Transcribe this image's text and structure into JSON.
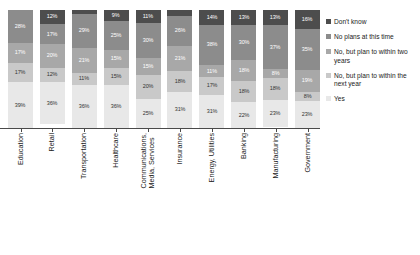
{
  "chart_data": {
    "type": "bar",
    "stacked": true,
    "stack_mode": "percent",
    "title": "",
    "subtitle": "",
    "xlabel": "",
    "ylabel": "",
    "ylim": [
      0,
      100
    ],
    "grid": false,
    "legend_position": "right",
    "value_suffix": "%",
    "categories": [
      "Education",
      "Retail",
      "Transportation",
      "Healthcare",
      "Communications, Media, Services",
      "Insurance",
      "Energy, Utilities",
      "Banking",
      "Manufacturing",
      "Government"
    ],
    "category_lines": [
      [
        "Education"
      ],
      [
        "Retail"
      ],
      [
        "Transportation"
      ],
      [
        "Healthcare"
      ],
      [
        "Communications,",
        "Media, Services"
      ],
      [
        "Insurance"
      ],
      [
        "Energy, Utilities"
      ],
      [
        "Banking"
      ],
      [
        "Manufacturing"
      ],
      [
        "Government"
      ]
    ],
    "series": [
      {
        "name": "Don't know",
        "color": "#4d4d4d",
        "text_color": "#ffffff",
        "values": [
          0,
          12,
          3,
          9,
          11,
          5,
          14,
          13,
          13,
          16
        ],
        "labels": [
          "",
          "12%",
          "",
          "9%",
          "11%",
          "",
          "14%",
          "13%",
          "13%",
          "16%"
        ]
      },
      {
        "name": "No plans at this time",
        "color": "#8c8c8c",
        "text_color": "#ffffff",
        "values": [
          28,
          17,
          29,
          25,
          30,
          26,
          38,
          30,
          37,
          35
        ],
        "labels": [
          "28%",
          "17%",
          "29%",
          "25%",
          "30%",
          "26%",
          "38%",
          "30%",
          "37%",
          "35%"
        ]
      },
      {
        "name": "No, but plan to within two years",
        "color": "#a8a8a8",
        "text_color": "#ffffff",
        "values": [
          17,
          20,
          21,
          15,
          15,
          21,
          11,
          18,
          8,
          19
        ],
        "labels": [
          "17%",
          "20%",
          "21%",
          "15%",
          "15%",
          "21%",
          "11%",
          "18%",
          "8%",
          "19%"
        ]
      },
      {
        "name": "No, but plan to within the next year",
        "color": "#c9c9c9",
        "text_color": "#333333",
        "values": [
          17,
          12,
          11,
          15,
          20,
          18,
          17,
          18,
          18,
          8
        ],
        "labels": [
          "17%",
          "12%",
          "11%",
          "15%",
          "20%",
          "18%",
          "17%",
          "18%",
          "18%",
          "8%"
        ]
      },
      {
        "name": "Yes",
        "color": "#e8e8e8",
        "text_color": "#333333",
        "values": [
          39,
          36,
          36,
          36,
          25,
          31,
          31,
          22,
          23,
          23
        ],
        "labels": [
          "39%",
          "36%",
          "36%",
          "36%",
          "25%",
          "31%",
          "31%",
          "22%",
          "23%",
          "23%"
        ]
      }
    ]
  },
  "legend": {
    "items": [
      {
        "label": "Don't know",
        "color": "#4d4d4d"
      },
      {
        "label": "No plans at this time",
        "color": "#8c8c8c"
      },
      {
        "label": "No, but plan to within two years",
        "color": "#a8a8a8"
      },
      {
        "label": "No, but plan to within the next year",
        "color": "#c9c9c9"
      },
      {
        "label": "Yes",
        "color": "#e8e8e8"
      }
    ]
  }
}
